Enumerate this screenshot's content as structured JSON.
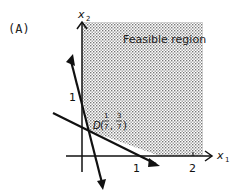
{
  "figure": {
    "panel_label": "(A)",
    "region_label": "Feasible region",
    "axes": {
      "x_label": "x",
      "x_sub": "1",
      "y_label": "x",
      "y_sub": "2",
      "x_ticks": [
        "1",
        "2"
      ],
      "y_ticks": [
        "1"
      ]
    },
    "point": {
      "name": "D",
      "x_num": "1",
      "x_den": "7",
      "y_num": "3",
      "y_den": "7"
    },
    "colors": {
      "lines": "#111111",
      "shading_dots": "#777777",
      "background": "#ffffff"
    }
  }
}
